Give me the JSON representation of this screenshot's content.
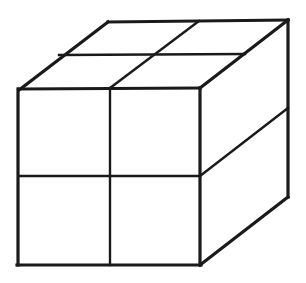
{
  "figure": {
    "title": "Cube subdivided into eight smaller cubes",
    "kind": "line-drawing",
    "background_color": "#ffffff",
    "line_color": "#1a1a1a",
    "canvas": {
      "width": 306,
      "height": 283
    },
    "projection": "oblique / cabinet-style axonometric",
    "subdivision": {
      "columns": 2,
      "rows": 2,
      "depth": 2,
      "total_small_cubes": 8
    },
    "visible_faces": [
      {
        "name": "front-face",
        "cells": 4,
        "cell_shape": "square"
      },
      {
        "name": "top-face",
        "cells": 4,
        "cell_shape": "parallelogram"
      },
      {
        "name": "right-face",
        "cells": 4,
        "cell_shape": "parallelogram"
      }
    ],
    "geometry": {
      "front_face": {
        "top_left": [
          19,
          89
        ],
        "top_right": [
          200,
          88
        ],
        "bottom_right": [
          200,
          265
        ],
        "bottom_left": [
          18,
          265
        ],
        "vertical_divider_x": 110,
        "horizontal_divider_y": 176
      },
      "top_face": {
        "front_left": [
          19,
          89
        ],
        "front_right": [
          200,
          88
        ],
        "back_right": [
          288,
          20
        ],
        "back_left": [
          108,
          22
        ],
        "lateral_divider": {
          "from": [
            59,
            55
          ],
          "to": [
            245,
            54
          ]
        },
        "depth_divider": {
          "from": [
            110,
            88
          ],
          "to": [
            199,
            21
          ]
        }
      },
      "right_face": {
        "front_top": [
          200,
          88
        ],
        "back_top": [
          288,
          20
        ],
        "back_bottom": [
          288,
          197
        ],
        "front_bottom": [
          200,
          265
        ],
        "horizontal_divider": {
          "from": [
            200,
            176
          ],
          "to": [
            288,
            108
          ]
        }
      }
    },
    "strokes": {
      "outer_width": 3.2,
      "inner_width": 2.4
    }
  }
}
